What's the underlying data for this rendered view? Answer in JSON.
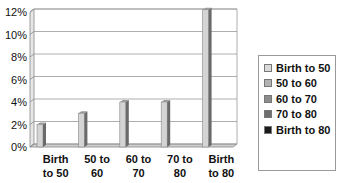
{
  "chart_data": {
    "type": "bar",
    "title": "",
    "xlabel": "",
    "ylabel": "",
    "ylim": [
      0,
      12
    ],
    "y_ticks": [
      "0%",
      "2%",
      "4%",
      "6%",
      "8%",
      "10%",
      "12%"
    ],
    "grid": true,
    "legend_position": "right",
    "categories": [
      "Birth to 50",
      "50 to 60",
      "60 to 70",
      "70 to 80",
      "Birth to 80"
    ],
    "category_labels": [
      [
        "Birth",
        "to 50"
      ],
      [
        "50 to",
        "60"
      ],
      [
        "60 to",
        "70"
      ],
      [
        "70 to",
        "80"
      ],
      [
        "Birth",
        "to 80"
      ]
    ],
    "series": [
      {
        "name": "Birth to 50",
        "color": "#d9d9d9",
        "values": [
          2,
          0,
          0,
          0,
          0
        ]
      },
      {
        "name": "50 to 60",
        "color": "#b3b3b3",
        "values": [
          0,
          3,
          0,
          0,
          0
        ]
      },
      {
        "name": "60 to 70",
        "color": "#8c8c8c",
        "values": [
          0,
          0,
          4,
          0,
          0
        ]
      },
      {
        "name": "70 to 80",
        "color": "#6e6e6e",
        "values": [
          0,
          0,
          0,
          4,
          0
        ]
      },
      {
        "name": "Birth to 80",
        "color": "#1a1a1a",
        "values": [
          0,
          0,
          0,
          0,
          12.2
        ]
      }
    ],
    "values": [
      2,
      3,
      4,
      4,
      12.2
    ]
  },
  "legend": {
    "items": [
      {
        "label": "Birth to 50",
        "color": "#d9d9d9"
      },
      {
        "label": "50 to 60",
        "color": "#b3b3b3"
      },
      {
        "label": "60 to 70",
        "color": "#8c8c8c"
      },
      {
        "label": "70 to 80",
        "color": "#6e6e6e"
      },
      {
        "label": "Birth to 80",
        "color": "#1a1a1a"
      }
    ]
  }
}
